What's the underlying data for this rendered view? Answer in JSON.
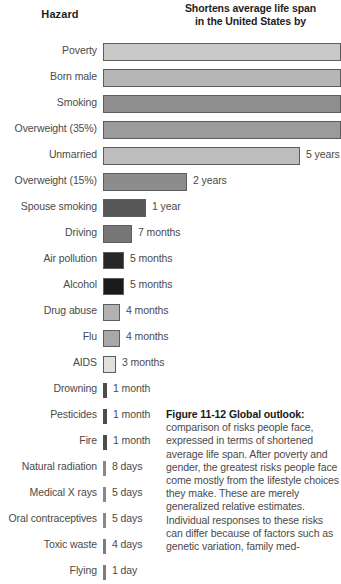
{
  "header": {
    "hazard_label": "Hazard",
    "span_label_line1": "Shortens average life span",
    "span_label_line2": "in the United States by"
  },
  "caption": {
    "title": "Figure 11-12  Global outlook:",
    "body": " comparison of risks people face, expressed in terms of shortened average life span. After poverty and gender, the greatest risks people face come mostly from the lifestyle choices they make. These are merely generalized relative estimates. Individual responses to these risks can differ because of factors such as genetic variation, family med-"
  },
  "colors": {
    "text": "#4a4a4a",
    "heading": "#1a1a1a",
    "outline": "#5c5c5c",
    "background": "#ffffff"
  },
  "chart_data": {
    "type": "bar",
    "orientation": "horizontal",
    "title": "Shortens average life span in the United States by",
    "xlabel": "",
    "ylabel": "Hazard",
    "grid": false,
    "legend": "none",
    "note": "Top four bars extend past the right edge of the image and are clipped; their value labels are not visible.",
    "categories": [
      "Poverty",
      "Born male",
      "Smoking",
      "Overweight (35%)",
      "Unmarried",
      "Overweight (15%)",
      "Spouse smoking",
      "Driving",
      "Air pollution",
      "Alcohol",
      "Drug abuse",
      "Flu",
      "AIDS",
      "Drowning",
      "Pesticides",
      "Fire",
      "Natural radiation",
      "Medical X rays",
      "Oral contraceptives",
      "Toxic waste",
      "Flying"
    ],
    "values": [
      {
        "label": "",
        "days": 3285,
        "fill": "#c9c9c9",
        "width": 238,
        "clipped": true
      },
      {
        "label": "",
        "days": 2920,
        "fill": "#b6b6b6",
        "width": 238,
        "clipped": true
      },
      {
        "label": "",
        "days": 2555,
        "fill": "#8e8e8e",
        "width": 238,
        "clipped": true
      },
      {
        "label": "",
        "days": 2190,
        "fill": "#9b9b9b",
        "width": 238,
        "clipped": true
      },
      {
        "label": "5 years",
        "days": 1825,
        "fill": "#bdbdbd",
        "width": 197,
        "clipped": false
      },
      {
        "label": "2 years",
        "days": 730,
        "fill": "#8c8c8c",
        "width": 84,
        "clipped": false
      },
      {
        "label": "1 year",
        "days": 365,
        "fill": "#575757",
        "width": 43,
        "clipped": false
      },
      {
        "label": "7 months",
        "days": 210,
        "fill": "#777777",
        "width": 29,
        "clipped": false
      },
      {
        "label": "5 months",
        "days": 150,
        "fill": "#272727",
        "width": 21,
        "clipped": false
      },
      {
        "label": "5 months",
        "days": 150,
        "fill": "#1b1b1b",
        "width": 21,
        "clipped": false
      },
      {
        "label": "4 months",
        "days": 120,
        "fill": "#b2b2b2",
        "width": 17,
        "clipped": false
      },
      {
        "label": "4 months",
        "days": 120,
        "fill": "#a8a8a8",
        "width": 17,
        "clipped": false
      },
      {
        "label": "3 months",
        "days": 90,
        "fill": "#e0e0e0",
        "width": 13,
        "clipped": false
      },
      {
        "label": "1 month",
        "days": 30,
        "fill": "#4d4d4d",
        "width": 4,
        "clipped": false
      },
      {
        "label": "1 month",
        "days": 30,
        "fill": "#4d4d4d",
        "width": 4,
        "clipped": false
      },
      {
        "label": "1 month",
        "days": 30,
        "fill": "#4d4d4d",
        "width": 4,
        "clipped": false
      },
      {
        "label": "8 days",
        "days": 8,
        "fill": "#888888",
        "width": 3,
        "clipped": false
      },
      {
        "label": "5 days",
        "days": 5,
        "fill": "#888888",
        "width": 3,
        "clipped": false
      },
      {
        "label": "5 days",
        "days": 5,
        "fill": "#888888",
        "width": 3,
        "clipped": false
      },
      {
        "label": "4 days",
        "days": 4,
        "fill": "#7d7d7d",
        "width": 3,
        "clipped": false
      },
      {
        "label": "1 day",
        "days": 1,
        "fill": "#7d7d7d",
        "width": 3,
        "clipped": false
      }
    ]
  }
}
